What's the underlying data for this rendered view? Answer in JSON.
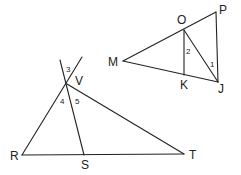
{
  "figures": [
    {
      "name": "triangle-MPJ",
      "points": [
        "M",
        "O",
        "P",
        "K",
        "J"
      ],
      "segments": [
        [
          "M",
          "P"
        ],
        [
          "M",
          "J"
        ],
        [
          "P",
          "J"
        ],
        [
          "O",
          "K"
        ],
        [
          "O",
          "J"
        ]
      ],
      "angle_labels": [
        "1",
        "2"
      ]
    },
    {
      "name": "triangle-RVT",
      "points": [
        "V",
        "R",
        "S",
        "T"
      ],
      "segments": [
        [
          "R",
          "V"
        ],
        [
          "V",
          "T"
        ],
        [
          "R",
          "T"
        ],
        [
          "V",
          "S"
        ]
      ],
      "angle_labels": [
        "3",
        "4",
        "5"
      ]
    }
  ],
  "labels": {
    "M": "M",
    "O": "O",
    "P": "P",
    "K": "K",
    "J": "J",
    "V": "V",
    "R": "R",
    "S": "S",
    "T": "T",
    "a1": "1",
    "a2": "2",
    "a3": "3",
    "a4": "4",
    "a5": "5"
  }
}
